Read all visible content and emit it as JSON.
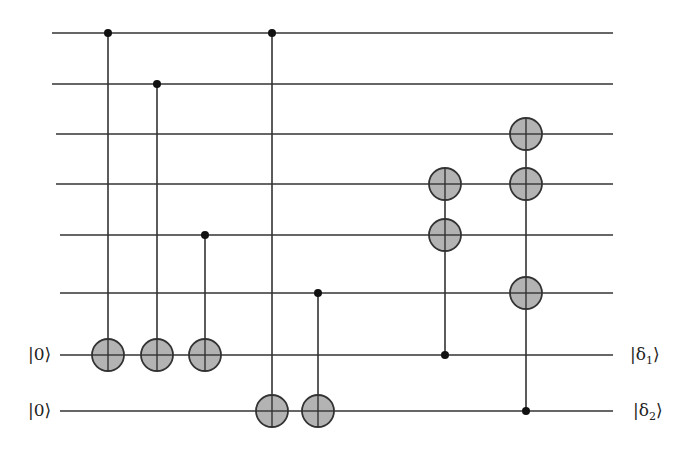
{
  "diagram": {
    "type": "quantum-circuit",
    "colors": {
      "wire": "#333333",
      "gate_fill": "#b3b3b3",
      "gate_stroke": "#333333",
      "control_dot": "#111111",
      "background": "#ffffff"
    },
    "wires": [
      {
        "index": 0,
        "y": 33,
        "x_start": 52,
        "x_end": 613,
        "input_label": "",
        "output_label": ""
      },
      {
        "index": 1,
        "y": 84,
        "x_start": 52,
        "x_end": 613,
        "input_label": "",
        "output_label": ""
      },
      {
        "index": 2,
        "y": 134,
        "x_start": 56,
        "x_end": 613,
        "input_label": "",
        "output_label": ""
      },
      {
        "index": 3,
        "y": 184,
        "x_start": 56,
        "x_end": 613,
        "input_label": "",
        "output_label": ""
      },
      {
        "index": 4,
        "y": 235,
        "x_start": 60,
        "x_end": 613,
        "input_label": "",
        "output_label": ""
      },
      {
        "index": 5,
        "y": 293,
        "x_start": 60,
        "x_end": 613,
        "input_label": "",
        "output_label": ""
      },
      {
        "index": 6,
        "y": 355,
        "x_start": 60,
        "x_end": 613,
        "input_label": "|0⟩",
        "output_label": "|δ₁⟩"
      },
      {
        "index": 7,
        "y": 411,
        "x_start": 60,
        "x_end": 613,
        "input_label": "|0⟩",
        "output_label": "|δ₂⟩"
      }
    ],
    "gates": [
      {
        "name": "cnot-1",
        "x": 108,
        "controls": [
          0
        ],
        "targets": [
          6
        ]
      },
      {
        "name": "cnot-2",
        "x": 157,
        "controls": [
          1
        ],
        "targets": [
          6
        ]
      },
      {
        "name": "cnot-3",
        "x": 205,
        "controls": [
          4
        ],
        "targets": [
          6
        ]
      },
      {
        "name": "cnot-4",
        "x": 272,
        "controls": [
          0
        ],
        "targets": [
          7
        ]
      },
      {
        "name": "cnot-5",
        "x": 318,
        "controls": [
          5
        ],
        "targets": [
          7
        ]
      },
      {
        "name": "fanout-1",
        "x": 445,
        "controls": [
          6
        ],
        "targets": [
          3,
          4
        ]
      },
      {
        "name": "fanout-2",
        "x": 526,
        "controls": [
          7
        ],
        "targets": [
          2,
          3,
          5
        ]
      }
    ],
    "target_radius": 16,
    "control_radius": 4,
    "labels": {
      "input_ancilla_1": "|0⟩",
      "input_ancilla_2": "|0⟩",
      "output_delta_1_prefix": "|δ",
      "output_delta_1_sub": "1",
      "output_delta_1_suffix": "⟩",
      "output_delta_2_prefix": "|δ",
      "output_delta_2_sub": "2",
      "output_delta_2_suffix": "⟩"
    }
  }
}
